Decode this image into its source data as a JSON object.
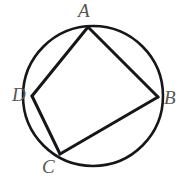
{
  "figure": {
    "background_color": "#ffffff",
    "stroke_color": "#16161a",
    "label_color": "#555555",
    "circle": {
      "name": "circumscribed-circle",
      "center_x": 93,
      "center_y": 96,
      "radius": 70,
      "stroke_width": 2.6
    },
    "vertices": [
      {
        "id": "A",
        "label": "A",
        "x": 88,
        "y": 27,
        "label_x": 78,
        "label_y": 1
      },
      {
        "id": "B",
        "label": "B",
        "x": 158,
        "y": 97,
        "label_x": 164,
        "label_y": 88
      },
      {
        "id": "C",
        "label": "C",
        "x": 60,
        "y": 154,
        "label_x": 42,
        "label_y": 157
      },
      {
        "id": "D",
        "label": "D",
        "x": 32,
        "y": 96,
        "label_x": 12,
        "label_y": 85
      }
    ],
    "chords": [
      {
        "id": "AB",
        "from": "A",
        "to": "B",
        "x1": 88,
        "y1": 27,
        "x2": 158,
        "y2": 97,
        "stroke_width": 3.0
      },
      {
        "id": "BC",
        "from": "B",
        "to": "C",
        "x1": 158,
        "y1": 97,
        "x2": 60,
        "y2": 154,
        "stroke_width": 3.0
      },
      {
        "id": "CD",
        "from": "C",
        "to": "D",
        "x1": 60,
        "y1": 154,
        "x2": 32,
        "y2": 96,
        "stroke_width": 3.0
      },
      {
        "id": "DA",
        "from": "D",
        "to": "A",
        "x1": 32,
        "y1": 96,
        "x2": 88,
        "y2": 27,
        "stroke_width": 3.0
      }
    ],
    "labels": {
      "A": "A",
      "B": "B",
      "C": "C",
      "D": "D"
    }
  }
}
